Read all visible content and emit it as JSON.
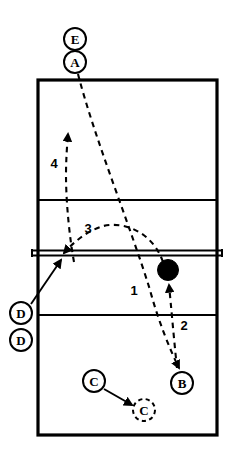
{
  "diagram": {
    "court": {
      "name": "volleyball-court",
      "outline": {
        "x": 38,
        "y": 80,
        "width": 179,
        "height": 355
      },
      "attack_line_top_y": 200,
      "attack_line_bottom_y": 315,
      "net_y": 253,
      "net_x1": 31,
      "net_x2": 223,
      "line_color": "#000000",
      "court_fill": "#ffffff"
    },
    "players": [
      {
        "id": "player-e",
        "label": "E",
        "cx": 75,
        "cy": 39,
        "r": 11,
        "style": "solid",
        "region": "above-court-top"
      },
      {
        "id": "player-a",
        "label": "A",
        "cx": 75,
        "cy": 62,
        "r": 11,
        "style": "solid",
        "region": "above-court-top"
      },
      {
        "id": "player-d-1",
        "label": "D",
        "cx": 21,
        "cy": 313,
        "r": 11,
        "style": "solid",
        "region": "left-of-court"
      },
      {
        "id": "player-d-2",
        "label": "D",
        "cx": 21,
        "cy": 340,
        "r": 11,
        "style": "solid",
        "region": "left-of-court"
      },
      {
        "id": "player-c-start",
        "label": "C",
        "cx": 94,
        "cy": 381,
        "r": 11,
        "style": "solid",
        "region": "near-court-bottom"
      },
      {
        "id": "player-c-target",
        "label": "C",
        "cx": 144,
        "cy": 410,
        "r": 11,
        "style": "dashed",
        "region": "near-court-bottom"
      },
      {
        "id": "player-b",
        "label": "B",
        "cx": 182,
        "cy": 383,
        "r": 11,
        "style": "solid",
        "region": "near-court-bottom"
      }
    ],
    "ball": {
      "id": "ball",
      "label": "ball",
      "cx": 168,
      "cy": 270,
      "r": 10.5,
      "fill": "#000000"
    },
    "sequence_labels": [
      {
        "id": "seq-1",
        "text": "1",
        "x": 134,
        "y": 290
      },
      {
        "id": "seq-2",
        "text": "2",
        "x": 184,
        "y": 325
      },
      {
        "id": "seq-3",
        "text": "3",
        "x": 88,
        "y": 228
      },
      {
        "id": "seq-4",
        "text": "4",
        "x": 54,
        "y": 163
      }
    ],
    "paths": [
      {
        "id": "path-1-serve",
        "name": "path-1-from-a-to-b",
        "style": "dashed",
        "d": "M 78 74 C 95 140, 130 225, 150 290 C 158 320, 170 350, 180 368",
        "arrow": {
          "x": 181,
          "y": 372,
          "angle": 62
        }
      },
      {
        "id": "path-2-pass",
        "name": "path-2-from-b-to-ball",
        "style": "dashed",
        "d": "M 177 368 C 174 340, 171 305, 169 284",
        "arrow": {
          "x": 168,
          "y": 280,
          "angle": -82
        }
      },
      {
        "id": "path-3-set",
        "name": "path-3-arc-over-net-to-left",
        "style": "dashed",
        "d": "M 163 262 C 150 232, 120 221, 100 228 C 84 234, 72 244, 64 254",
        "arrow": {
          "x": 62,
          "y": 256,
          "angle": 140
        }
      },
      {
        "id": "path-4-approach",
        "name": "path-4-upward-approach",
        "style": "dashed",
        "d": "M 74 262 C 70 240, 66 205, 66 175 C 66 160, 67 146, 68 136",
        "arrow": {
          "x": 68,
          "y": 130,
          "angle": -84
        }
      },
      {
        "id": "path-d-move",
        "name": "path-d-to-net-solid",
        "style": "solid",
        "d": "M 30 305 L 60 262",
        "arrow": {
          "x": 62,
          "y": 259,
          "angle": -55
        }
      },
      {
        "id": "path-c-move",
        "name": "path-c-start-to-target-solid",
        "style": "solid",
        "d": "M 104 389 L 131 404",
        "arrow": {
          "x": 134,
          "y": 406,
          "angle": 29
        }
      }
    ],
    "colors": {
      "stroke": "#000000",
      "fill": "#ffffff",
      "ball": "#000000"
    }
  }
}
